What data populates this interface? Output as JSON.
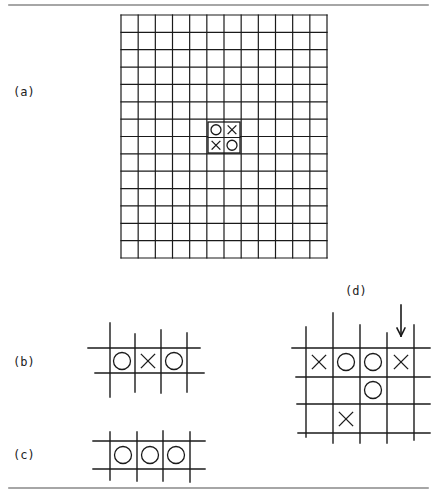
{
  "figure": {
    "rules": {
      "top": {
        "x1": 9,
        "x2": 428,
        "y": 5
      },
      "bottom": {
        "x1": 9,
        "x2": 428,
        "y": 488
      },
      "color": "#888888"
    },
    "ink_color": "#1a1a1a"
  },
  "panels": {
    "a": {
      "label": "(a)",
      "label_pos": {
        "x": 13,
        "y": 85
      },
      "board": {
        "columns": 12,
        "rows": 14,
        "x": 121,
        "y": 15,
        "width": 206,
        "height": 243
      },
      "inset": {
        "x": 208,
        "y": 122,
        "width": 32,
        "height": 31,
        "cells": [
          [
            "O",
            "X"
          ],
          [
            "X",
            "O"
          ]
        ]
      }
    },
    "b": {
      "label": "(b)",
      "label_pos": {
        "x": 13,
        "y": 355
      },
      "vlines": [
        {
          "x": 110,
          "y1": 323,
          "y2": 397
        },
        {
          "x": 135,
          "y1": 334,
          "y2": 392
        },
        {
          "x": 161,
          "y1": 330,
          "y2": 393
        },
        {
          "x": 187,
          "y1": 333,
          "y2": 392
        }
      ],
      "hlines": [
        {
          "y": 348,
          "x1": 88,
          "x2": 200
        },
        {
          "y": 373,
          "x1": 95,
          "x2": 204
        }
      ],
      "pieces": [
        {
          "mark": "O",
          "cx": 122,
          "cy": 361
        },
        {
          "mark": "X",
          "cx": 148,
          "cy": 361
        },
        {
          "mark": "O",
          "cx": 174,
          "cy": 361
        }
      ]
    },
    "c": {
      "label": "(c)",
      "label_pos": {
        "x": 13,
        "y": 448
      },
      "vlines": [
        {
          "x": 110,
          "y1": 432,
          "y2": 480
        },
        {
          "x": 137,
          "y1": 432,
          "y2": 481
        },
        {
          "x": 163,
          "y1": 431,
          "y2": 481
        },
        {
          "x": 190,
          "y1": 432,
          "y2": 482
        }
      ],
      "hlines": [
        {
          "y": 441,
          "x1": 93,
          "x2": 205
        },
        {
          "y": 469,
          "x1": 93,
          "x2": 205
        }
      ],
      "pieces": [
        {
          "mark": "O",
          "cx": 123,
          "cy": 455
        },
        {
          "mark": "O",
          "cx": 150,
          "cy": 455
        },
        {
          "mark": "O",
          "cx": 176,
          "cy": 455
        }
      ]
    },
    "d": {
      "label": "(d)",
      "label_pos": {
        "x": 345,
        "y": 284
      },
      "vlines": [
        {
          "x": 306,
          "y1": 327,
          "y2": 437
        },
        {
          "x": 333,
          "y1": 313,
          "y2": 443
        },
        {
          "x": 360,
          "y1": 325,
          "y2": 443
        },
        {
          "x": 387,
          "y1": 333,
          "y2": 443
        },
        {
          "x": 414,
          "y1": 325,
          "y2": 440
        }
      ],
      "hlines": [
        {
          "y": 348,
          "x1": 292,
          "x2": 430
        },
        {
          "y": 377,
          "x1": 296,
          "x2": 430
        },
        {
          "y": 404,
          "x1": 297,
          "x2": 430
        },
        {
          "y": 433,
          "x1": 298,
          "x2": 430
        }
      ],
      "pieces": [
        {
          "mark": "X",
          "cx": 319,
          "cy": 362
        },
        {
          "mark": "O",
          "cx": 346,
          "cy": 362
        },
        {
          "mark": "O",
          "cx": 373,
          "cy": 362
        },
        {
          "mark": "X",
          "cx": 401,
          "cy": 362
        },
        {
          "mark": "O",
          "cx": 373,
          "cy": 390
        },
        {
          "mark": "X",
          "cx": 346,
          "cy": 419
        }
      ],
      "arrow": {
        "x": 401,
        "y1": 305,
        "y2": 336,
        "direction": "down"
      }
    }
  }
}
